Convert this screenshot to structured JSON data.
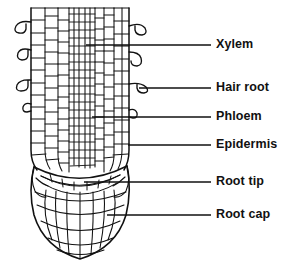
{
  "figure": {
    "background_color": "#ffffff",
    "ink_color": "#111111",
    "width": 290,
    "height": 274
  },
  "labels": [
    {
      "id": "xylem",
      "text": "Xylem",
      "text_x": 216,
      "text_y": 38,
      "line_y": 45,
      "line_x1": 86,
      "line_x2": 211
    },
    {
      "id": "hair_root",
      "text": "Hair root",
      "text_x": 216,
      "text_y": 81,
      "line_y": 88,
      "line_x1": 139,
      "line_x2": 211
    },
    {
      "id": "phloem",
      "text": "Phloem",
      "text_x": 216,
      "text_y": 110,
      "line_y": 117,
      "line_x1": 92,
      "line_x2": 211
    },
    {
      "id": "epidermis",
      "text": "Epidermis",
      "text_x": 216,
      "text_y": 138,
      "line_y": 145,
      "line_x1": 128,
      "line_x2": 211
    },
    {
      "id": "root_tip",
      "text": "Root tip",
      "text_x": 216,
      "text_y": 175,
      "line_y": 182,
      "line_x1": 84,
      "line_x2": 211
    },
    {
      "id": "root_cap",
      "text": "Root cap",
      "text_x": 216,
      "text_y": 208,
      "line_y": 215,
      "line_x1": 107,
      "line_x2": 211
    }
  ],
  "structure": {
    "root_body": {
      "name": "root-body",
      "left_x": 31,
      "right_x": 129,
      "top_y": 8,
      "tip_y": 172
    },
    "root_cap": {
      "name": "root-cap",
      "top_y": 168,
      "bottom_y": 259,
      "left_x": 37,
      "right_x": 125
    },
    "root_hairs_left": [
      {
        "y": 26
      },
      {
        "y": 54
      },
      {
        "y": 82
      },
      {
        "y": 106
      }
    ],
    "root_hairs_right": [
      {
        "y": 30
      },
      {
        "y": 58
      },
      {
        "y": 86
      },
      {
        "y": 110
      }
    ],
    "tissue_zones": [
      {
        "name": "epidermis",
        "note": "outer cell layer"
      },
      {
        "name": "cortex",
        "note": "broad rectangular cell files"
      },
      {
        "name": "xylem",
        "note": "central narrow strand"
      },
      {
        "name": "phloem",
        "note": "narrow strands flanking xylem"
      },
      {
        "name": "root-tip",
        "note": "meristem at apex"
      },
      {
        "name": "root-cap",
        "note": "dome of radiating cells at apex"
      }
    ]
  }
}
